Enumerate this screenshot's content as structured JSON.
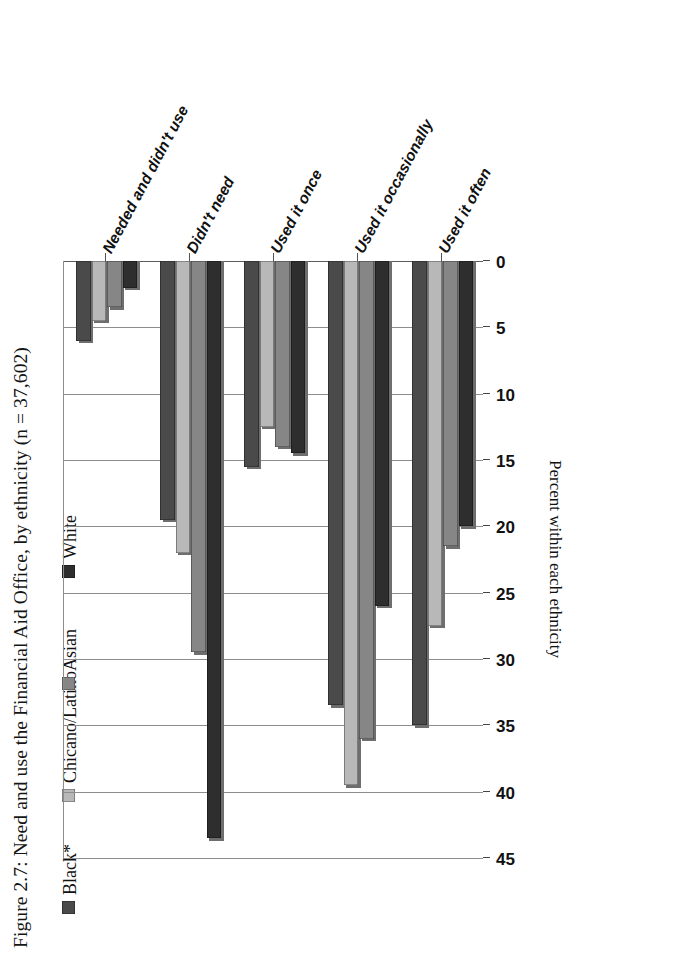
{
  "figure": {
    "caption": "Figure 2.7: Need and use the Financial Aid Office, by ethnicity (n = 37,602)"
  },
  "axis": {
    "y_title": "Percent within each ethnicity",
    "ticks": [
      "0",
      "5",
      "10",
      "15",
      "20",
      "25",
      "30",
      "35",
      "40",
      "45"
    ]
  },
  "legend": {
    "items": [
      {
        "label": "Black*",
        "color": "#4a4a4a"
      },
      {
        "label": "Chicano/Latino",
        "color": "#b8b8b8"
      },
      {
        "label": "Asian",
        "color": "#868686"
      },
      {
        "label": "White",
        "color": "#2e2e2e"
      }
    ]
  },
  "chart_data": {
    "type": "bar",
    "orientation": "vertical-rotated",
    "title": "Figure 2.7: Need and use the Financial Aid Office, by ethnicity (n = 37,602)",
    "xlabel": "",
    "ylabel": "Percent within each ethnicity",
    "ylim": [
      0,
      45
    ],
    "ytick_step": 5,
    "grid": true,
    "legend_position": "top-right",
    "categories": [
      "Needed and didn't use",
      "Didn't need",
      "Used it once",
      "Used it occasionally",
      "Used it often"
    ],
    "series": [
      {
        "name": "Black*",
        "color": "#4a4a4a",
        "values": [
          6.0,
          19.5,
          15.5,
          33.5,
          35.0
        ]
      },
      {
        "name": "Chicano/Latino",
        "color": "#b8b8b8",
        "values": [
          4.5,
          22.0,
          12.5,
          39.5,
          27.5
        ]
      },
      {
        "name": "Asian",
        "color": "#868686",
        "values": [
          3.5,
          29.5,
          14.0,
          36.0,
          21.5
        ]
      },
      {
        "name": "White",
        "color": "#2e2e2e",
        "values": [
          2.0,
          43.5,
          14.5,
          26.0,
          20.0
        ]
      }
    ]
  }
}
